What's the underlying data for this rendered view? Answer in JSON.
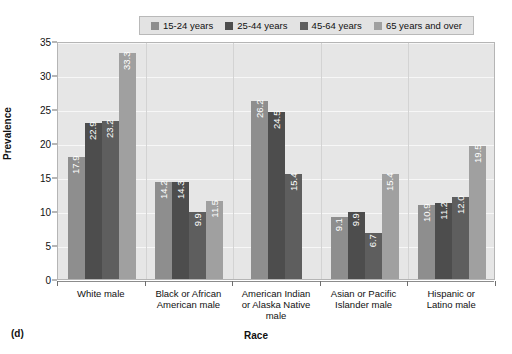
{
  "figure": {
    "panel_label": "(d)"
  },
  "chart_data": {
    "type": "bar",
    "title": "",
    "subtitle": "",
    "xlabel": "Race",
    "ylabel": "Prevalence",
    "ylim": [
      0,
      35
    ],
    "ytick_values": [
      0,
      5,
      10,
      15,
      20,
      25,
      30,
      35
    ],
    "ytick_labels": [
      "0",
      "5",
      "10",
      "15",
      "20",
      "25",
      "30",
      "35"
    ],
    "grid": true,
    "grid_axis": "y",
    "legend_position": "top",
    "legend": [
      "15-24 years",
      "25-44 years",
      "45-64 years",
      "65 years and over"
    ],
    "categories": [
      "White male",
      "Black or African American male",
      "American Indian or Alaska Native male",
      "Asian or Pacific Islander male",
      "Hispanic or Latino male"
    ],
    "category_label_lines": [
      [
        "White male"
      ],
      [
        "Black or African",
        "American male"
      ],
      [
        "American Indian",
        "or Alaska Native",
        "male"
      ],
      [
        "Asian or Pacific",
        "Islander male"
      ],
      [
        "Hispanic or",
        "Latino male"
      ]
    ],
    "series": [
      {
        "name": "15-24 years",
        "color": "#8e8e8e",
        "values": [
          17.9,
          14.2,
          26.2,
          9.1,
          10.9
        ],
        "labels": [
          "17.9",
          "14.2",
          "26.2",
          "9.1",
          "10.9"
        ]
      },
      {
        "name": "25-44 years",
        "color": "#4d4d4d",
        "values": [
          22.9,
          14.3,
          24.5,
          9.9,
          11.2
        ],
        "labels": [
          "22.9",
          "14.3",
          "24.5",
          "9.9",
          "11.2"
        ]
      },
      {
        "name": "45-64 years",
        "color": "#5e5e5e",
        "values": [
          23.2,
          9.9,
          15.4,
          6.7,
          12.0
        ],
        "labels": [
          "23.2",
          "9.9",
          "15.4",
          "6.7",
          "12.0"
        ]
      },
      {
        "name": "65 years and over",
        "color": "#a0a0a0",
        "values": [
          33.3,
          11.5,
          null,
          15.4,
          19.5
        ],
        "labels": [
          "33.3",
          "11.5",
          "",
          "15.4",
          "19.5"
        ]
      }
    ],
    "plot_background": "#e6e6e6",
    "legend_background": "#e3e3e3",
    "axis_color": "#6e6e6e",
    "gridline_color": "#f7f7f7"
  }
}
